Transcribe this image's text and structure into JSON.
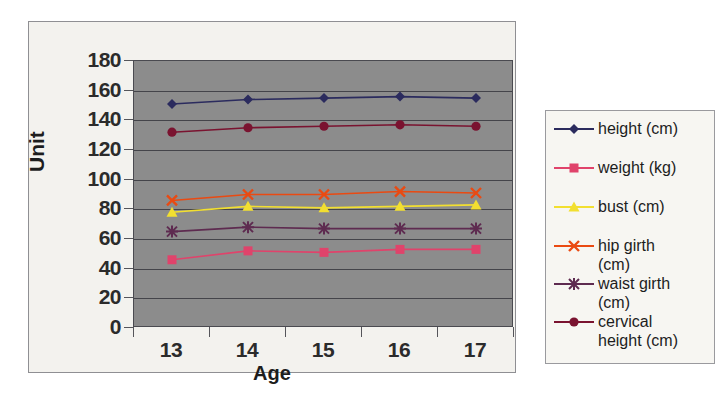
{
  "chart_data": {
    "type": "line",
    "title": "",
    "xlabel": "Age",
    "ylabel": "Unit",
    "categories": [
      "13",
      "14",
      "15",
      "16",
      "17"
    ],
    "x": [
      13,
      14,
      15,
      16,
      17
    ],
    "ylim": [
      0,
      180
    ],
    "yticks": [
      "180",
      "160",
      "140",
      "120",
      "100",
      "80",
      "60",
      "40",
      "20",
      "0"
    ],
    "ytick_values": [
      180,
      160,
      140,
      120,
      100,
      80,
      60,
      40,
      20,
      0
    ],
    "grid": true,
    "legend_position": "right",
    "plot_background": "#8c8c8c",
    "panel_background": "#f3f2ee",
    "series": [
      {
        "name": "height (cm)",
        "values": [
          151,
          154,
          155,
          156,
          155
        ],
        "color": "#2b2b5e",
        "marker": "diamond"
      },
      {
        "name": "weight (kg)",
        "values": [
          46,
          52,
          51,
          53,
          53
        ],
        "color": "#e0436b",
        "marker": "square"
      },
      {
        "name": "bust (cm)",
        "values": [
          78,
          82,
          81,
          82,
          83
        ],
        "color": "#f2df30",
        "marker": "triangle"
      },
      {
        "name": "hip girth (cm)",
        "values": [
          86,
          90,
          90,
          92,
          91
        ],
        "color": "#ea4a12",
        "marker": "cross"
      },
      {
        "name": "waist girth (cm)",
        "values": [
          65,
          68,
          67,
          67,
          67
        ],
        "color": "#5e2b50",
        "marker": "asterisk"
      },
      {
        "name": "cervical height (cm)",
        "values": [
          132,
          135,
          136,
          137,
          136
        ],
        "color": "#7a1330",
        "marker": "circle"
      }
    ]
  },
  "legend": {
    "entries": [
      {
        "label": "height (cm)"
      },
      {
        "label": "weight (kg)"
      },
      {
        "label": "bust (cm)"
      },
      {
        "label": "hip girth\n(cm)"
      },
      {
        "label": "waist girth\n(cm)"
      },
      {
        "label": "cervical\nheight (cm)"
      }
    ]
  }
}
